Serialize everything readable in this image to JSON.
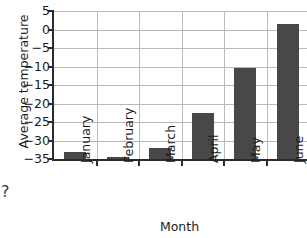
{
  "chart_data": {
    "type": "bar",
    "title": "",
    "xlabel": "Month",
    "ylabel": "Average temperature",
    "categories": [
      "January",
      "February",
      "March",
      "April",
      "May",
      "June"
    ],
    "values": [
      -33,
      -34.5,
      -32,
      -22.5,
      -10.5,
      1.5
    ],
    "ylim": [
      -35,
      5
    ],
    "yticks": [
      5,
      0,
      -5,
      -10,
      -15,
      -20,
      -25,
      -30,
      -35
    ],
    "ytick_labels": [
      "5",
      "0",
      "−5",
      "−10",
      "−15",
      "−20",
      "−25",
      "−30",
      "−35"
    ],
    "grid": true,
    "grid_axis": "both",
    "legend": false,
    "legend_position": "none",
    "bar_color": "#484848",
    "grid_color": "#b9b9b9",
    "axis_color": "#2b2b2b"
  },
  "artifacts": {
    "stray_glyph": "?"
  }
}
